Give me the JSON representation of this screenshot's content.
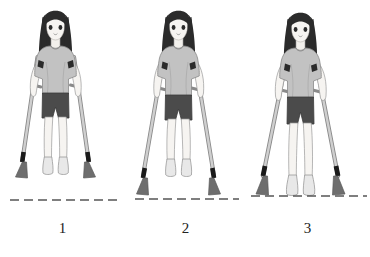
{
  "illustration": {
    "title": "Person walking with forearm crutches - three-point gait sequence",
    "background_color": "#ffffff",
    "panel_count": 3
  },
  "palette": {
    "hair": "#2b2b2b",
    "hair_highlight": "#4a4a4a",
    "skin": "#f2f0ec",
    "skin_outline": "#8d8d8d",
    "shirt": "#c2c2c2",
    "shirt_shadow": "#b0b0b0",
    "shirt_outline": "#8a8a8a",
    "shorts": "#4b4b4b",
    "shorts_outline": "#3a3a3a",
    "shoe": "#e8e8e8",
    "shoe_outline": "#9a9a9a",
    "crutch_shaft": "#bdbdbd",
    "crutch_outline": "#8a8a8a",
    "crutch_cuff": "#2b2b2b",
    "crutch_band": "#1a1a1a",
    "crutch_tip": "#6e6e6e",
    "ground_line": "#555555",
    "caption_text": "#222222"
  },
  "panels": [
    {
      "caption": "1",
      "name": "step-one",
      "description": "Standing upright, crutches held near vertical, both crutch tips and both feet lifted above the ground line",
      "ground_line": {
        "visible": true,
        "style": "dashed",
        "x_start": 10,
        "x_end": 118,
        "y": 200
      },
      "crutch_contact": false,
      "foot_contact": false
    },
    {
      "caption": "2",
      "name": "step-two",
      "description": "Crutches advanced and splayed outward, both crutch tips planted on the ground line, both feet lifted",
      "ground_line": {
        "visible": true,
        "style": "dashed",
        "x_start": 12,
        "x_end": 116,
        "y": 208
      },
      "crutch_contact": true,
      "foot_contact": false
    },
    {
      "caption": "3",
      "name": "step-three",
      "description": "Crutches splayed widest and planted, both feet swung through and resting on the ground line",
      "ground_line": {
        "visible": true,
        "style": "dashed",
        "x_start": 6,
        "x_end": 122,
        "y": 208
      },
      "crutch_contact": true,
      "foot_contact": true
    }
  ],
  "figure_features": {
    "hair": "long straight dark hair with straight bangs",
    "top": "short-sleeved light gray t-shirt",
    "bottom": "dark charcoal shorts",
    "footwear": "light gray slip-on shoes",
    "mobility_aid": "pair of forearm crutches with dark arm cuffs and dark gray rubber tips"
  }
}
